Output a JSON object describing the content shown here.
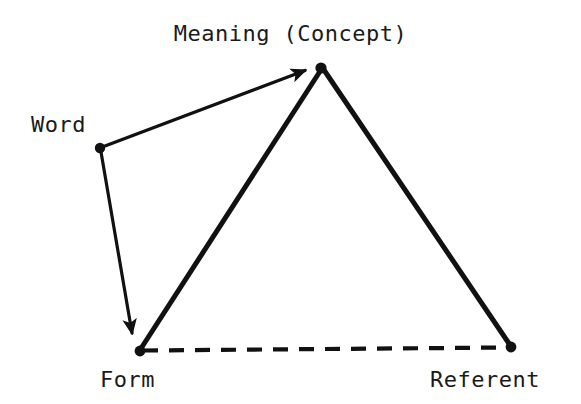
{
  "diagram": {
    "background_color": "#ffffff",
    "stroke_color": "#111111",
    "label_color": "#1a1a1a",
    "nodes": [
      {
        "id": "meaning",
        "label": "Meaning (Concept)",
        "x": 321,
        "y": 68,
        "dot_radius": 5
      },
      {
        "id": "word",
        "label": "Word",
        "x": 100,
        "y": 148,
        "dot_radius": 5
      },
      {
        "id": "form",
        "label": "Form",
        "x": 140,
        "y": 351,
        "dot_radius": 5
      },
      {
        "id": "referent",
        "label": "Referent",
        "x": 511,
        "y": 347,
        "dot_radius": 5
      }
    ],
    "edges": [
      {
        "id": "word-to-meaning",
        "from": "word",
        "to": "meaning",
        "style": "solid",
        "width": 3,
        "arrow": "end"
      },
      {
        "id": "word-to-form",
        "from": "word",
        "to": "form",
        "style": "solid",
        "width": 3,
        "arrow": "end"
      },
      {
        "id": "form-to-meaning",
        "from": "form",
        "to": "meaning",
        "style": "solid",
        "width": 5,
        "arrow": "none"
      },
      {
        "id": "meaning-to-referent",
        "from": "meaning",
        "to": "referent",
        "style": "solid",
        "width": 5,
        "arrow": "none"
      },
      {
        "id": "form-to-referent",
        "from": "form",
        "to": "referent",
        "style": "dashed",
        "width": 4,
        "arrow": "none",
        "dash_pattern": "15 11"
      }
    ]
  },
  "labels": {
    "meaning": "Meaning (Concept)",
    "word": "Word",
    "form": "Form",
    "referent": "Referent"
  }
}
